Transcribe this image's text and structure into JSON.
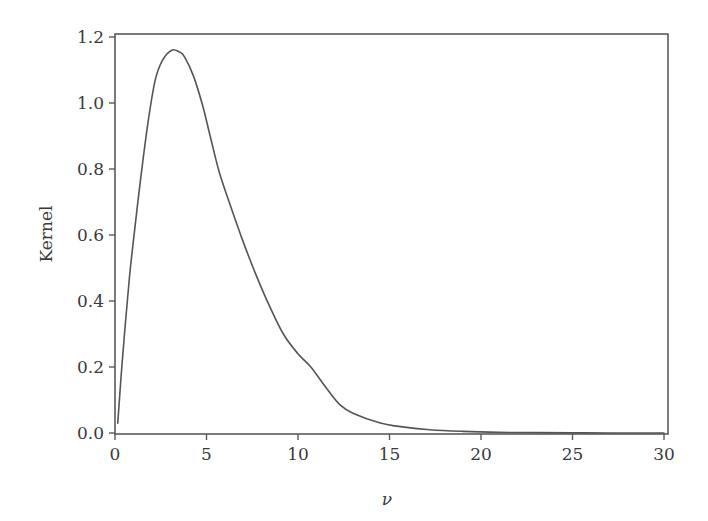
{
  "chart_data": {
    "type": "line",
    "title": "",
    "xlabel": "ν",
    "ylabel": "Kernel",
    "xlim": [
      0,
      30
    ],
    "ylim": [
      0,
      1.2
    ],
    "grid": false,
    "legend": null,
    "xticks": [
      0,
      5,
      10,
      15,
      20,
      25,
      30
    ],
    "xtick_labels": [
      "0",
      "5",
      "10",
      "15",
      "20",
      "25",
      "30"
    ],
    "yticks": [
      0.0,
      0.2,
      0.4,
      0.6,
      0.8,
      1.0,
      1.2
    ],
    "ytick_labels": [
      "0.0",
      "0.2",
      "0.4",
      "0.6",
      "0.8",
      "1.0",
      "1.2"
    ],
    "series": [
      {
        "name": "Kernel",
        "color": "#555555",
        "x": [
          0.15,
          0.4,
          0.77,
          1.0,
          1.4,
          1.8,
          2.2,
          2.6,
          3.1,
          3.5,
          3.8,
          4.3,
          4.8,
          5.2,
          5.7,
          6.3,
          7.0,
          7.7,
          8.4,
          9.2,
          10.0,
          10.7,
          11.5,
          12.3,
          13.0,
          14.5,
          15.5,
          17.2,
          19.0,
          21.0,
          23.0,
          25.0,
          27.0,
          30.0
        ],
        "y": [
          0.03,
          0.22,
          0.46,
          0.58,
          0.77,
          0.94,
          1.07,
          1.13,
          1.16,
          1.155,
          1.14,
          1.08,
          0.99,
          0.9,
          0.79,
          0.69,
          0.58,
          0.48,
          0.39,
          0.3,
          0.24,
          0.2,
          0.14,
          0.085,
          0.06,
          0.03,
          0.02,
          0.01,
          0.005,
          0.002,
          0.001,
          0.0005,
          0.0002,
          0.0
        ]
      }
    ]
  }
}
